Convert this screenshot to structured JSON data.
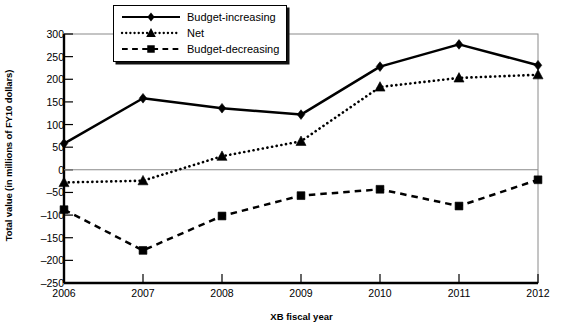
{
  "chart_data": {
    "type": "line",
    "title": "",
    "xlabel": "XB fiscal year",
    "ylabel": "Total value (in millions of FY10 dollars)",
    "categories": [
      "2006",
      "2007",
      "2008",
      "2009",
      "2010",
      "2011",
      "2012"
    ],
    "x": [
      2006,
      2007,
      2008,
      2009,
      2010,
      2011,
      2012
    ],
    "ylim": [
      -250,
      300
    ],
    "yticks": [
      300,
      250,
      200,
      150,
      100,
      50,
      0,
      -50,
      -100,
      -150,
      -200,
      -250
    ],
    "ytick_labels": [
      "300",
      "250",
      "200",
      "150",
      "100",
      "50",
      "0",
      "–50",
      "–100",
      "–150",
      "–200",
      "–250"
    ],
    "grid": false,
    "zero_line": true,
    "legend_position": "top-center",
    "series": [
      {
        "name": "Budget-increasing",
        "values": [
          58,
          158,
          136,
          122,
          228,
          277,
          231
        ],
        "style": "solid",
        "marker": "diamond",
        "color": "#000000"
      },
      {
        "name": "Net",
        "values": [
          -28,
          -24,
          30,
          63,
          183,
          203,
          210
        ],
        "style": "dotted",
        "marker": "triangle",
        "color": "#000000"
      },
      {
        "name": "Budget-decreasing",
        "values": [
          -88,
          -178,
          -102,
          -57,
          -43,
          -80,
          -22
        ],
        "style": "dashed",
        "marker": "square",
        "color": "#000000"
      }
    ]
  },
  "legend": {
    "items": [
      {
        "label": "Budget-increasing",
        "style": "solid",
        "marker": "diamond"
      },
      {
        "label": "Net",
        "style": "dotted",
        "marker": "triangle"
      },
      {
        "label": "Budget-decreasing",
        "style": "dashed",
        "marker": "square"
      }
    ]
  },
  "colors": {
    "foreground": "#000000",
    "axis": "#000000",
    "zero_line": "#8a8a8a",
    "plot_border": "#8a8a8a",
    "background": "#ffffff"
  }
}
